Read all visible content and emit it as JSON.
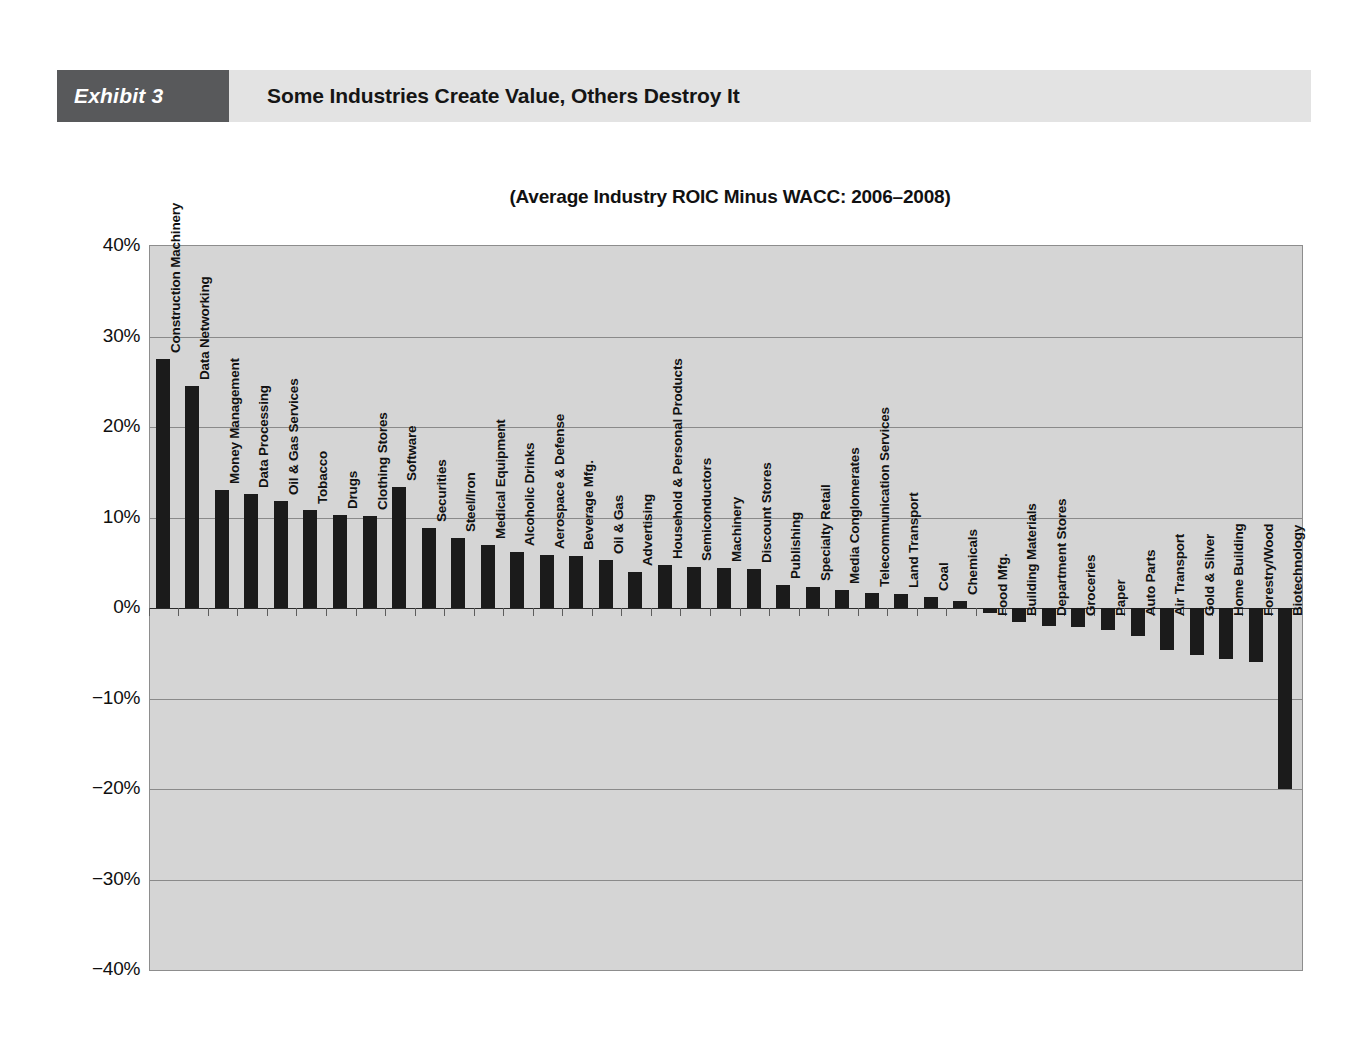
{
  "exhibit": {
    "tag": "Exhibit 3",
    "title": "Some Industries Create Value, Others Destroy It"
  },
  "chart_data": {
    "type": "bar",
    "title": "(Average Industry ROIC Minus WACC: 2006–2008)",
    "xlabel": "",
    "ylabel": "",
    "ylim": [
      -40,
      40
    ],
    "ytick_labels": [
      "40%",
      "30%",
      "20%",
      "10%",
      "0%",
      "−10%",
      "−20%",
      "−30%",
      "−40%"
    ],
    "ytick_values": [
      40,
      30,
      20,
      10,
      0,
      -10,
      -20,
      -30,
      -40
    ],
    "grid": true,
    "legend": "none",
    "value_unit": "percent",
    "categories": [
      "Construction Machinery",
      "Data Networking",
      "Money Management",
      "Data Processing",
      "Oil & Gas Services",
      "Tobacco",
      "Drugs",
      "Clothing Stores",
      "Software",
      "Securities",
      "Steel/Iron",
      "Medical Equipment",
      "Alcoholic Drinks",
      "Aerospace & Defense",
      "Beverage Mfg.",
      "Oil & Gas",
      "Advertising",
      "Household & Personal Products",
      "Semiconductors",
      "Machinery",
      "Discount Stores",
      "Publishing",
      "Specialty Retail",
      "Media Conglomerates",
      "Telecommunication Services",
      "Land Transport",
      "Coal",
      "Chemicals",
      "Food Mfg.",
      "Building Materials",
      "Department Stores",
      "Groceries",
      "Paper",
      "Auto Parts",
      "Air Transport",
      "Gold & Silver",
      "Home Building",
      "Forestry/Wood",
      "Biotechnology"
    ],
    "values": [
      27.5,
      24.5,
      13.0,
      12.6,
      11.8,
      10.8,
      10.3,
      10.2,
      13.4,
      8.8,
      7.7,
      7.0,
      6.2,
      5.9,
      5.8,
      5.3,
      4.0,
      4.8,
      4.5,
      4.4,
      4.3,
      2.5,
      2.3,
      2.0,
      1.7,
      1.6,
      1.2,
      0.8,
      -0.6,
      -1.6,
      -2.0,
      -2.1,
      -2.4,
      -3.1,
      -4.6,
      -5.2,
      -5.6,
      -6.0,
      -20.0
    ]
  }
}
